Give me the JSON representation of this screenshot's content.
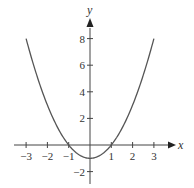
{
  "chart_data": {
    "type": "line",
    "title": "",
    "function": "y = x^2 - 1",
    "xlabel": "x",
    "ylabel": "y",
    "xlim": [
      -3.5,
      4
    ],
    "ylim": [
      -3,
      9
    ],
    "x_ticks": [
      -3,
      -2,
      -1,
      1,
      2,
      3
    ],
    "x_tick_labels": [
      "−3",
      "−2",
      "−1",
      "1",
      "2",
      "3"
    ],
    "y_ticks": [
      8,
      6,
      4,
      2,
      -2
    ],
    "y_tick_labels": [
      "8",
      "6",
      "4",
      "2",
      "−2"
    ],
    "grid": false,
    "legend": null,
    "series": [
      {
        "name": "parabola",
        "x": [
          -3,
          -2.5,
          -2,
          -1.5,
          -1,
          -0.5,
          0,
          0.5,
          1,
          1.5,
          2,
          2.5,
          3
        ],
        "y": [
          8,
          5.25,
          3,
          1.25,
          0,
          -0.75,
          -1,
          -0.75,
          0,
          1.25,
          3,
          5.25,
          8
        ],
        "color": "#555555"
      }
    ]
  }
}
